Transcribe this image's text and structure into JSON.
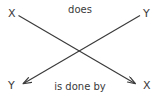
{
  "diagram": {
    "type": "crossed-relationship-diagram",
    "background_color": "#ffffff",
    "stroke_color": "#3a3a3a",
    "text_color": "#3a3a3a",
    "nodes": [
      {
        "id": "x-top-left",
        "label": "X",
        "position": "top-left"
      },
      {
        "id": "y-top-right",
        "label": "Y",
        "position": "top-right"
      },
      {
        "id": "y-bottom-left",
        "label": "Y",
        "position": "bottom-left"
      },
      {
        "id": "x-bottom-right",
        "label": "X",
        "position": "bottom-right"
      }
    ],
    "edges": [
      {
        "id": "does",
        "label": "does",
        "from": "x-top-left",
        "to": "x-bottom-right",
        "arrowhead": "end",
        "direction": "top-left-to-bottom-right"
      },
      {
        "id": "is-done-by",
        "label": "is done by",
        "from": "y-top-right",
        "to": "y-bottom-left",
        "arrowhead": "end",
        "direction": "top-right-to-bottom-left"
      }
    ]
  }
}
